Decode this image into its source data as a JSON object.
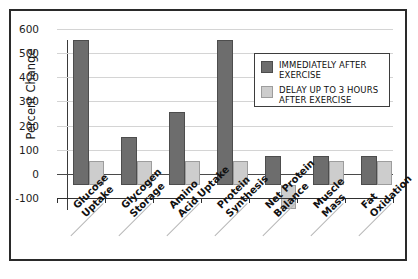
{
  "chart_data": {
    "type": "bar",
    "title": "",
    "xlabel": "",
    "ylabel": "Percent Change",
    "ylim": [
      -100,
      600
    ],
    "yticks": [
      -100,
      0,
      100,
      200,
      300,
      400,
      500,
      600
    ],
    "ytick_labels": [
      "-100",
      "0",
      "100",
      "200",
      "300",
      "400",
      "500",
      "600"
    ],
    "grid": true,
    "legend_position": "upper right",
    "categories": [
      "Glucose Uptake",
      "Glycogen Storage",
      "Amino Acid Uptake",
      "Protein Synthesis",
      "Net Protein Balance",
      "Muscle Mass",
      "Fat Oxidation"
    ],
    "category_lines": [
      [
        "Glucose",
        "Uptake"
      ],
      [
        "Glycogen",
        "Storage"
      ],
      [
        "Amino",
        "Acid Uptake"
      ],
      [
        "Protein",
        "Synthesis"
      ],
      [
        "Net Protein",
        "Balance"
      ],
      [
        "Muscle",
        "Mass"
      ],
      [
        "Fat",
        "Oxidation"
      ]
    ],
    "series": [
      {
        "name": "IMMEDIATELY AFTER EXERCISE",
        "color": "#6d6d6d",
        "values": [
          600,
          200,
          300,
          600,
          120,
          120,
          120
        ]
      },
      {
        "name": "DELAY UP TO 3 HOURS AFTER EXERCISE",
        "color": "#cdcdcd",
        "values": [
          100,
          100,
          100,
          100,
          -100,
          100,
          100
        ]
      }
    ]
  },
  "legend": {
    "entries": [
      {
        "label": "IMMEDIATELY AFTER EXERCISE",
        "swatch": "dark"
      },
      {
        "label": "DELAY UP TO 3 HOURS AFTER EXERCISE",
        "swatch": "light"
      }
    ]
  },
  "colors": {
    "dark_bar": "#6d6d6d",
    "light_bar": "#cdcdcd",
    "gridline": "#d4d4d4",
    "frame": "#2a2a2a",
    "background": "#ffffff"
  }
}
